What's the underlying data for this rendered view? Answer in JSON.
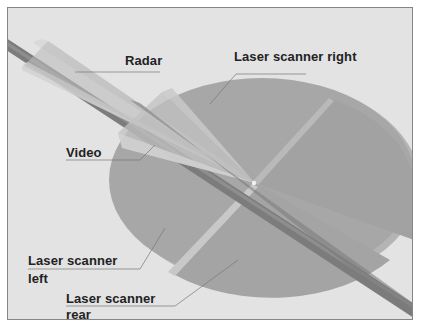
{
  "diagram": {
    "type": "sensor-coverage-diagram",
    "background_color": "#e3e3e3",
    "disc_color": "#a9a9a9",
    "road_color": "#7a7a7a",
    "labels": {
      "radar": "Radar",
      "laser_scanner_right": "Laser scanner right",
      "video": "Video",
      "laser_scanner_left_line1": "Laser scanner",
      "laser_scanner_left_line2": "left",
      "laser_scanner_rear_line1": "Laser scanner",
      "laser_scanner_rear_line2": "rear"
    },
    "sensors": [
      {
        "name": "Radar",
        "coverage": "long narrow forward cone"
      },
      {
        "name": "Video",
        "coverage": "medium forward cone"
      },
      {
        "name": "Laser scanner right",
        "coverage": "disc quadrant right"
      },
      {
        "name": "Laser scanner left",
        "coverage": "disc quadrant left"
      },
      {
        "name": "Laser scanner rear",
        "coverage": "disc quadrant rear"
      }
    ]
  }
}
